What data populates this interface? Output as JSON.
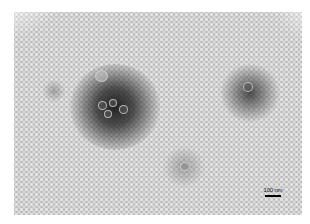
{
  "image": {
    "type": "transmission electron micrograph (negative stain)",
    "description": "Grayscale micrograph with a dense field of small light dots, a large dark stained region with a few round particles at center-left, a smaller dark region at right, and a faint cluster near the bottom center.",
    "background_color": "#b9b9b9",
    "dot_color": "#e4e4e4",
    "dark_region_color": "#1e1e1e"
  },
  "scale_bar": {
    "label": "100 nm",
    "color": "#000000"
  }
}
